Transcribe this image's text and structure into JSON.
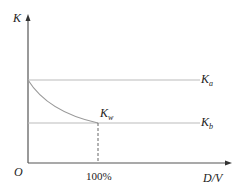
{
  "diagram": {
    "y_axis_label": "K",
    "x_axis_label": "D/V",
    "origin_label": "O",
    "x_tick_label": "100%",
    "lines": [
      {
        "name": "K_a",
        "main": "K",
        "sub": "a"
      },
      {
        "name": "K_b",
        "main": "K",
        "sub": "b"
      }
    ],
    "curve_end_label": {
      "main": "K",
      "sub": "w"
    },
    "colors": {
      "axis": "#555555",
      "reference_lines": "#bbbbbb",
      "curve": "#999999",
      "dashed": "#666666"
    }
  }
}
